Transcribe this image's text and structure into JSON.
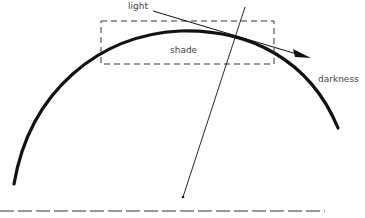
{
  "diagram": {
    "labels": {
      "light": "light",
      "shade": "shade",
      "darkness": "darkness"
    },
    "colors": {
      "stroke": "#111111",
      "dash": "#333333",
      "text": "#444444",
      "background": "#ffffff"
    },
    "elements": {
      "curved_surface": "thick arc representing a curved surface",
      "light_ray": "arrow from light grazing the surface toward darkness",
      "shade_box": "dashed rectangle marking the shade region",
      "normal_line": "thin line crossing the surface down toward a point",
      "ground_line": "dashed horizontal line at bottom"
    }
  }
}
